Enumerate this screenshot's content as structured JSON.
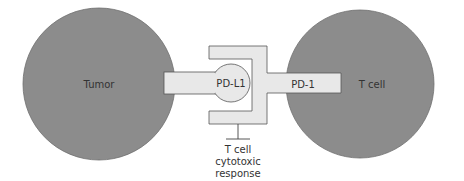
{
  "diagram": {
    "nodes": {
      "tumor": {
        "label": "Tumor"
      },
      "t_cell": {
        "label": "T cell"
      },
      "pd_l1": {
        "label": "PD-L1"
      },
      "pd_1": {
        "label": "PD-1"
      }
    },
    "inhibition": {
      "line1": "T cell",
      "line2": "cytotoxic",
      "line3": "response"
    },
    "colors": {
      "cell_fill": "#8c8c8c",
      "receptor_fill": "#e8e8e8",
      "outline": "#555555",
      "text": "#333333"
    }
  }
}
